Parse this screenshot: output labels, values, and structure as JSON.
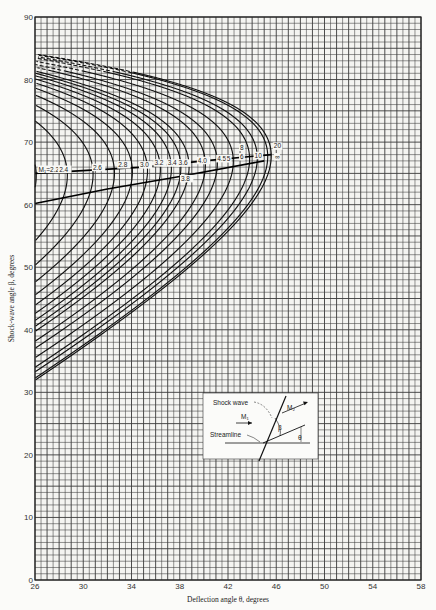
{
  "chart_data": {
    "type": "line",
    "title": "",
    "xlabel": "Deflection angle θ, degrees",
    "ylabel": "Shock-wave angle β, degrees",
    "xlim": [
      26,
      58
    ],
    "ylim": [
      0,
      90
    ],
    "x_ticks": [
      26,
      30,
      34,
      38,
      42,
      46,
      50,
      54,
      58
    ],
    "y_ticks": [
      0,
      10,
      20,
      30,
      40,
      50,
      60,
      70,
      80,
      90
    ],
    "grid": true,
    "gamma": 1.4,
    "series_mach": [
      2.2,
      2.4,
      2.6,
      2.8,
      3.0,
      3.2,
      3.4,
      3.6,
      3.8,
      4.0,
      4.5,
      5,
      6,
      8,
      10,
      20,
      "∞"
    ],
    "mach_labels": [
      {
        "text": "M₁=2.2",
        "theta": 26.3,
        "beta": 65.3
      },
      {
        "text": "2.4",
        "theta": 28.0,
        "beta": 65.3
      },
      {
        "text": "2.6",
        "theta": 30.8,
        "beta": 65.6
      },
      {
        "text": "2.8",
        "theta": 32.9,
        "beta": 66.0
      },
      {
        "text": "3.0",
        "theta": 34.7,
        "beta": 66.0
      },
      {
        "text": "3.2",
        "theta": 35.9,
        "beta": 66.3
      },
      {
        "text": "3.4",
        "theta": 37.0,
        "beta": 66.3
      },
      {
        "text": "3.6",
        "theta": 37.9,
        "beta": 66.3
      },
      {
        "text": "3.8",
        "theta": 38.1,
        "beta": 63.8
      },
      {
        "text": "4.0",
        "theta": 39.5,
        "beta": 66.7
      },
      {
        "text": "4.5",
        "theta": 41.1,
        "beta": 67.0
      },
      {
        "text": "5",
        "theta": 41.9,
        "beta": 67.0
      },
      {
        "text": "6",
        "theta": 43.0,
        "beta": 67.3
      },
      {
        "text": "8",
        "theta": 43.0,
        "beta": 68.8
      },
      {
        "text": "10",
        "theta": 44.2,
        "beta": 67.5
      },
      {
        "text": "20",
        "theta": 45.8,
        "beta": 69.0
      },
      {
        "text": "∞",
        "theta": 45.9,
        "beta": 67.3
      }
    ],
    "loci": [
      {
        "name": "maximum deflection locus",
        "points": [
          [
            26,
            65.0
          ],
          [
            35,
            66.0
          ],
          [
            40,
            67.0
          ],
          [
            45.6,
            68.0
          ]
        ]
      },
      {
        "name": "sonic (M₂ = 1) locus",
        "points": [
          [
            26,
            60.2
          ],
          [
            32,
            62.5
          ],
          [
            38,
            64.5
          ],
          [
            45.0,
            67.0
          ]
        ]
      }
    ],
    "sample_points": [
      {
        "M": 2.2,
        "theta_max": 26.1,
        "beta_at_theta26_weak": 54.0
      },
      {
        "M": 3.0,
        "theta_max": 34.1,
        "beta_at_theta26_weak": 41.7
      },
      {
        "M": 5.0,
        "theta_max": 41.1,
        "beta_at_theta26_weak": 35.4
      },
      {
        "M": "∞",
        "theta_max": 45.6,
        "beta_at_theta26_weak": 32.0
      }
    ]
  },
  "inset": {
    "shock_label": "Shock wave",
    "m1_label": "M₁",
    "m2_label": "M₂",
    "streamline_label": "Streamline",
    "beta_symbol": "β",
    "theta_symbol": "θ"
  }
}
